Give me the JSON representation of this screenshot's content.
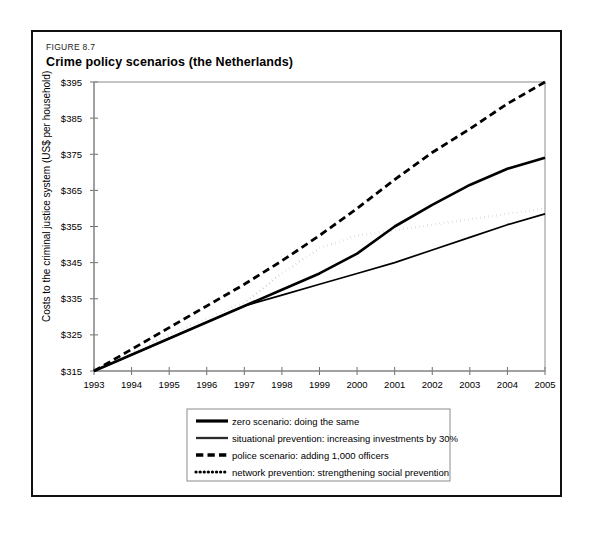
{
  "figure": {
    "number": "FIGURE 8.7",
    "title": "Crime policy scenarios (the Netherlands)"
  },
  "chart_data": {
    "type": "line",
    "title": "Crime policy scenarios (the Netherlands)",
    "xlabel": "",
    "ylabel": "Costs to the criminal justice system (US$ per household)",
    "categories": [
      "1993",
      "1994",
      "1995",
      "1996",
      "1997",
      "1998",
      "1999",
      "2000",
      "2001",
      "2002",
      "2003",
      "2004",
      "2005"
    ],
    "x": [
      1993,
      1994,
      1995,
      1996,
      1997,
      1998,
      1999,
      2000,
      2001,
      2002,
      2003,
      2004,
      2005
    ],
    "xlim": [
      1993,
      2005
    ],
    "ylim": [
      315,
      395
    ],
    "yticks": [
      315,
      325,
      335,
      345,
      355,
      365,
      375,
      385,
      395
    ],
    "ytick_labels": [
      "$315",
      "$325",
      "$335",
      "$345",
      "$355",
      "$365",
      "$375",
      "$385",
      "$395"
    ],
    "grid": false,
    "legend_position": "below-plot",
    "series": [
      {
        "name": "zero scenario: doing the same",
        "style": "solid",
        "width": 2.6,
        "color": "#000000",
        "values": [
          315.0,
          319.5,
          324.0,
          328.5,
          333.0,
          337.5,
          342.0,
          347.5,
          355.0,
          361.0,
          366.5,
          371.0,
          374.0
        ]
      },
      {
        "name": "situational prevention: increasing investments by 30%",
        "style": "solid",
        "width": 1.7,
        "color": "#2b2b2b",
        "values": [
          315.0,
          319.5,
          324.0,
          328.5,
          333.0,
          336.0,
          339.0,
          342.0,
          345.0,
          348.5,
          352.0,
          355.5,
          358.5
        ]
      },
      {
        "name": "police scenario: adding 1,000 officers",
        "style": "dashed",
        "width": 2.8,
        "color": "#000000",
        "values": [
          315.0,
          321.0,
          327.0,
          333.0,
          339.0,
          345.5,
          352.5,
          360.0,
          368.0,
          375.5,
          382.0,
          389.0,
          395.0
        ]
      },
      {
        "name": "network prevention: strengthening social prevention",
        "style": "dotted",
        "width": 2.6,
        "color": "#000000",
        "values": [
          315.0,
          320.0,
          325.0,
          329.5,
          334.0,
          342.0,
          349.0,
          352.5,
          354.0,
          355.5,
          357.0,
          358.5,
          360.0
        ]
      }
    ]
  },
  "legend": {
    "items": [
      {
        "label": "zero scenario: doing the same",
        "swatch": "solid-thick-line-swatch"
      },
      {
        "label": "situational prevention: increasing investments by 30%",
        "swatch": "solid-thin-line-swatch"
      },
      {
        "label": "police scenario: adding 1,000 officers",
        "swatch": "dashed-line-swatch"
      },
      {
        "label": "network prevention: strengthening social prevention",
        "swatch": "dotted-line-swatch"
      }
    ]
  }
}
